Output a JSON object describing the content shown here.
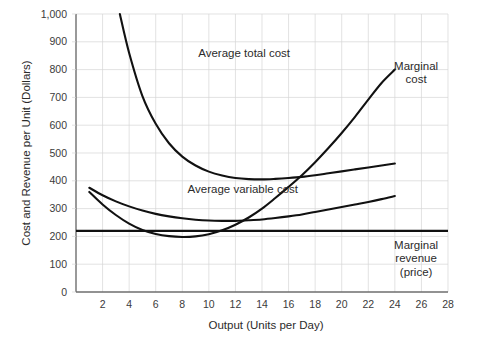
{
  "chart_data": {
    "type": "line",
    "title": "",
    "xlabel": "Output (Units per Day)",
    "ylabel": "Cost and Revenue per Unit (Dollars)",
    "xlim": [
      0,
      28
    ],
    "ylim": [
      0,
      1000
    ],
    "grid": true,
    "legend_position": "inline-annotations",
    "xticks": [
      2,
      4,
      6,
      8,
      10,
      12,
      14,
      16,
      18,
      20,
      22,
      24,
      26,
      28
    ],
    "xtick_labels": [
      "2",
      "4",
      "6",
      "8",
      "10",
      "12",
      "14",
      "16",
      "18",
      "20",
      "22",
      "24",
      "26",
      "28"
    ],
    "yticks": [
      0,
      100,
      200,
      300,
      400,
      500,
      600,
      700,
      800,
      900,
      1000
    ],
    "ytick_labels": [
      "0",
      "100",
      "200",
      "300",
      "400",
      "500",
      "600",
      "700",
      "800",
      "900",
      "1,000"
    ],
    "annotations": [
      {
        "text": "Average total cost",
        "x": 9.2,
        "y": 845
      },
      {
        "text": "Average variable cost",
        "x": 8.4,
        "y": 357
      },
      {
        "text": "Marginal cost",
        "x": 25.6,
        "y": 800
      },
      {
        "text": "Marginal revenue (price)",
        "x": 25.6,
        "y": 155
      }
    ],
    "series": [
      {
        "name": "Average total cost",
        "x": [
          3.3,
          4,
          5,
          6,
          7,
          8,
          9,
          10,
          11,
          12,
          13,
          14,
          15,
          16,
          17,
          18,
          19,
          20,
          21,
          22,
          23,
          24
        ],
        "values": [
          1000,
          860,
          705,
          605,
          535,
          487,
          455,
          433,
          419,
          410,
          406,
          405,
          407,
          410,
          414,
          420,
          427,
          434,
          441,
          448,
          455,
          462
        ]
      },
      {
        "name": "Average variable cost",
        "x": [
          1,
          2,
          3,
          4,
          5,
          6,
          7,
          8,
          9,
          10,
          11,
          12,
          13,
          14,
          15,
          16,
          17,
          18,
          19,
          20,
          21,
          22,
          23,
          24
        ],
        "values": [
          375,
          348,
          326,
          308,
          293,
          281,
          272,
          265,
          260,
          257,
          256,
          256,
          258,
          261,
          266,
          272,
          279,
          288,
          297,
          306,
          315,
          324,
          334,
          345
        ]
      },
      {
        "name": "Marginal cost",
        "x": [
          1,
          2,
          3,
          4,
          5,
          6,
          7,
          8,
          9,
          10,
          11,
          12,
          13,
          14,
          15,
          16,
          17,
          18,
          19,
          20,
          21,
          22,
          23,
          24
        ],
        "values": [
          360,
          315,
          277,
          246,
          223,
          209,
          201,
          198,
          200,
          208,
          222,
          242,
          268,
          300,
          338,
          378,
          420,
          467,
          518,
          572,
          630,
          692,
          752,
          800
        ]
      },
      {
        "name": "Marginal revenue (price)",
        "x": [
          0,
          28
        ],
        "values": [
          220,
          220
        ]
      }
    ],
    "colors": {
      "curve": "#111111",
      "grid": "#d6d6d6",
      "axis": "#6e6e6e",
      "text": "#2b2b2b",
      "background": "#ffffff"
    }
  }
}
